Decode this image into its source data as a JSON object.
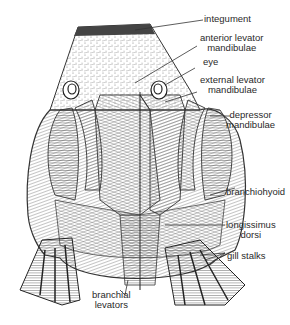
{
  "figure": {
    "labels": [
      {
        "id": "integument",
        "lines": [
          "integument"
        ]
      },
      {
        "id": "anterior-levator-mandibulae",
        "lines": [
          "anterior levator",
          "mandibulae"
        ]
      },
      {
        "id": "eye",
        "lines": [
          "eye"
        ]
      },
      {
        "id": "external-levator-mandibulae",
        "lines": [
          "external levator",
          "mandibulae"
        ]
      },
      {
        "id": "depressor-mandibulae",
        "lines": [
          "depressor",
          "mandibulae"
        ]
      },
      {
        "id": "branchiohyoid",
        "lines": [
          "branchiohyoid"
        ]
      },
      {
        "id": "longissimus-dorsi",
        "lines": [
          "longissimus",
          "dorsi"
        ]
      },
      {
        "id": "gill-stalks",
        "lines": [
          "gill stalks"
        ]
      },
      {
        "id": "branchial-levators",
        "lines": [
          "branchial",
          "levators"
        ]
      }
    ],
    "caption": ""
  },
  "colors": {
    "ink": "#2a2a2a",
    "background": "#ffffff",
    "shade": "#8a8a8a"
  }
}
